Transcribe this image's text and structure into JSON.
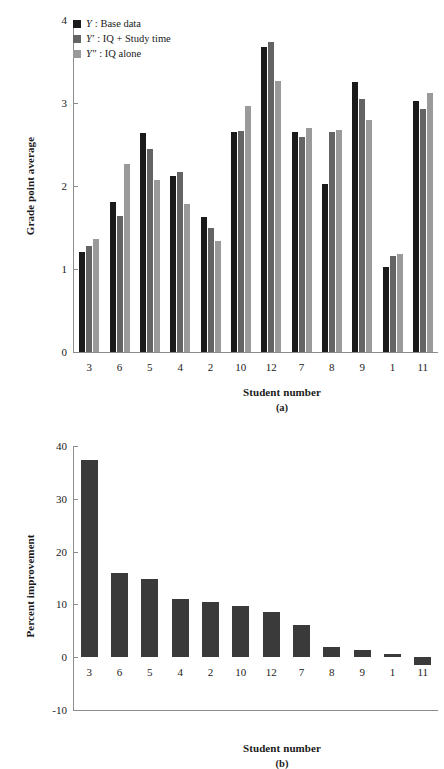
{
  "figure": {
    "width": 444,
    "height": 760
  },
  "colors": {
    "base": "#1a1a1a",
    "iq_study": "#646464",
    "iq_alone": "#9a9a9a",
    "axis": "#8c8c8c",
    "text": "#1a1a1a",
    "background": "#ffffff"
  },
  "panel_a": {
    "caption": "(a)",
    "legend": [
      {
        "swatch": "base",
        "symbol": "Y",
        "label": ":  Base data"
      },
      {
        "swatch": "iq_study",
        "symbol": "Y′",
        "label": ":  IQ + Study time"
      },
      {
        "swatch": "iq_alone",
        "symbol": "Y″",
        "label": ":  IQ alone"
      }
    ],
    "chart_data": {
      "type": "bar",
      "title": "",
      "xlabel": "Student number",
      "ylabel": "Grade point average",
      "categories": [
        "3",
        "6",
        "5",
        "4",
        "2",
        "10",
        "12",
        "7",
        "8",
        "9",
        "1",
        "11"
      ],
      "ylim": [
        0,
        4
      ],
      "yticks": [
        0,
        1,
        2,
        3,
        4
      ],
      "ytick_labels": [
        "0",
        "1",
        "2",
        "3",
        "4"
      ],
      "grid": false,
      "legend_position": "top-left",
      "series": [
        {
          "name": "Y: Base data",
          "color": "#1a1a1a",
          "values": [
            1.21,
            1.81,
            2.64,
            2.12,
            1.63,
            2.65,
            3.68,
            2.65,
            2.02,
            3.25,
            1.02,
            3.03
          ]
        },
        {
          "name": "Y′: IQ + Study time",
          "color": "#646464",
          "values": [
            1.28,
            1.64,
            2.45,
            2.17,
            1.5,
            2.66,
            3.74,
            2.59,
            2.65,
            3.05,
            1.16,
            2.93
          ]
        },
        {
          "name": "Y″: IQ alone",
          "color": "#9a9a9a",
          "values": [
            1.36,
            2.27,
            2.07,
            1.78,
            1.34,
            2.96,
            3.27,
            2.7,
            2.68,
            2.8,
            1.18,
            3.12
          ]
        }
      ]
    }
  },
  "panel_b": {
    "caption": "(b)",
    "chart_data": {
      "type": "bar",
      "title": "",
      "xlabel": "Student number",
      "ylabel": "Percent improvement",
      "categories": [
        "3",
        "6",
        "5",
        "4",
        "2",
        "10",
        "12",
        "7",
        "8",
        "9",
        "1",
        "11"
      ],
      "ylim": [
        -10,
        40
      ],
      "yticks": [
        -10,
        0,
        10,
        20,
        30,
        40
      ],
      "ytick_labels": [
        "-10",
        "0",
        "10",
        "20",
        "30",
        "40"
      ],
      "grid": false,
      "legend_position": "none",
      "series": [
        {
          "name": "Percent improvement",
          "color": "#3a3a3a",
          "values": [
            37.4,
            16.0,
            14.9,
            11.0,
            10.5,
            9.7,
            8.6,
            6.1,
            2.0,
            1.4,
            0.6,
            -1.4
          ]
        }
      ]
    }
  }
}
